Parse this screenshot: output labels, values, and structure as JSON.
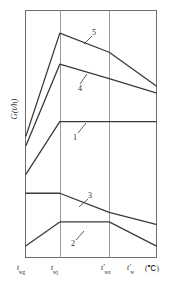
{
  "chart_data": {
    "type": "line",
    "title": "",
    "subtitle": "",
    "xlabel": "",
    "ylabel": "G(t/h)",
    "x_unit": "(℃)",
    "grid": true,
    "legend_position": "inline-labels",
    "xlim": [
      0,
      100
    ],
    "ylim": [
      0,
      100
    ],
    "x_tick_positions": [
      0,
      26,
      64,
      86
    ],
    "x_tick_labels": [
      "t_wg",
      "t_wj",
      "t'_wz",
      "t'_w"
    ],
    "x_tick_labels_display": [
      {
        "base": "t",
        "sub": "wg",
        "prime": false
      },
      {
        "base": "t",
        "sub": "wj",
        "prime": false
      },
      {
        "base": "t",
        "sub": "wz",
        "prime": true
      },
      {
        "base": "t",
        "sub": "w",
        "prime": true
      }
    ],
    "gridlines_x": [
      26,
      64
    ],
    "series": [
      {
        "name": "1",
        "label": "1",
        "points": [
          [
            0,
            33
          ],
          [
            26,
            55
          ],
          [
            64,
            55
          ],
          [
            100,
            55
          ]
        ]
      },
      {
        "name": "2",
        "label": "2",
        "points": [
          [
            0,
            3
          ],
          [
            26,
            13
          ],
          [
            64,
            13
          ],
          [
            100,
            3
          ]
        ]
      },
      {
        "name": "3",
        "label": "3",
        "points": [
          [
            0,
            25
          ],
          [
            26,
            25
          ],
          [
            64,
            17
          ],
          [
            100,
            12
          ]
        ]
      },
      {
        "name": "4",
        "label": "4",
        "points": [
          [
            0,
            45
          ],
          [
            26,
            79
          ],
          [
            64,
            73
          ],
          [
            100,
            67
          ]
        ]
      },
      {
        "name": "5",
        "label": "5",
        "points": [
          [
            0,
            49
          ],
          [
            26,
            92
          ],
          [
            64,
            84
          ],
          [
            100,
            70
          ]
        ]
      }
    ],
    "annotations": [
      {
        "text": "5",
        "series": "5",
        "x": 62,
        "y": 95
      },
      {
        "text": "4",
        "series": "4",
        "x": 48,
        "y": 70
      },
      {
        "text": "1",
        "series": "1",
        "x": 47,
        "y": 48
      },
      {
        "text": "3",
        "series": "3",
        "x": 48,
        "y": 28
      },
      {
        "text": "2",
        "series": "2",
        "x": 44,
        "y": 8
      }
    ]
  },
  "axis": {
    "y_label": "G(t/h)",
    "x_unit": "(℃)"
  },
  "ticks": {
    "t1_base": "t",
    "t1_sub": "wg",
    "t2_base": "t",
    "t2_sub": "wj",
    "t3_base": "t′",
    "t3_sub": "wz",
    "t4_base": "t′",
    "t4_sub": "w"
  },
  "curve_labels": {
    "one": "1",
    "two": "2",
    "three": "3",
    "four": "4",
    "five": "5"
  },
  "colors": {
    "frame": "#6e6e6e",
    "grid": "#9a9a9a",
    "curve": "#3a3a3a",
    "leader": "#4a4a4a",
    "text": "#2b2b2b",
    "background": "#ffffff"
  }
}
